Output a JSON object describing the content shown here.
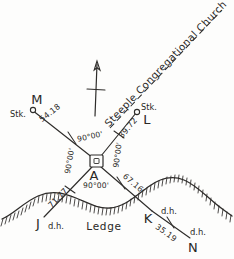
{
  "figure": {
    "kind": "survey-sketch",
    "ink_color": "#2e2c2a",
    "paper_color": "#fdfdfc"
  },
  "stations": {
    "center": {
      "label": "A",
      "marker": "square-monument-symbol"
    },
    "northwest": {
      "label": "M",
      "marker": "circle-stake-symbol",
      "note": "Stk."
    },
    "northeast": {
      "label": "L",
      "marker": "circle-stake-symbol",
      "note": "Stk."
    },
    "southwest": {
      "label": "J",
      "note": "d.h."
    },
    "south_ledge": {
      "label": "K",
      "note": "d.h."
    },
    "southeast": {
      "label": "N",
      "note": "d.h."
    }
  },
  "distances": {
    "a_to_m": "54.18",
    "a_to_l": "39.72",
    "a_to_j": "71.77",
    "a_to_k": "67.16",
    "k_to_n": "35.19"
  },
  "angles": {
    "upper_left": "90°00'",
    "upper_right": "90°00'",
    "lower_left": "90°00'",
    "lower_right": "90°00'"
  },
  "annotations": {
    "sight_line": "Steeple Congregational Church",
    "terrain": "Ledge",
    "north_arrow": "north-arrow-icon"
  }
}
